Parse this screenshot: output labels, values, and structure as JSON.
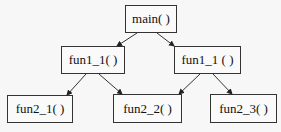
{
  "diagram": {
    "type": "call-tree",
    "nodes": [
      {
        "id": "main",
        "label": "main( )",
        "x": 125,
        "y": 5,
        "w": 52,
        "h": 28
      },
      {
        "id": "fun1_1a",
        "label": "fun1_1( )",
        "x": 61,
        "y": 46,
        "w": 64,
        "h": 28
      },
      {
        "id": "fun1_1b",
        "label": "fun1_1 ( )",
        "x": 174,
        "y": 46,
        "w": 67,
        "h": 28
      },
      {
        "id": "fun2_1",
        "label": "fun2_1( )",
        "x": 7,
        "y": 95,
        "w": 66,
        "h": 28
      },
      {
        "id": "fun2_2",
        "label": "fun2_2( )",
        "x": 113,
        "y": 94,
        "w": 69,
        "h": 29
      },
      {
        "id": "fun2_3",
        "label": "fun2_3( )",
        "x": 210,
        "y": 94,
        "w": 67,
        "h": 29
      }
    ],
    "edges": [
      {
        "from": "main",
        "to": "fun1_1a",
        "x1": 137,
        "y1": 33,
        "x2": 117,
        "y2": 46
      },
      {
        "from": "main",
        "to": "fun1_1b",
        "x1": 157,
        "y1": 33,
        "x2": 174,
        "y2": 46
      },
      {
        "from": "fun1_1a",
        "to": "fun2_1",
        "x1": 86,
        "y1": 74,
        "x2": 67,
        "y2": 95
      },
      {
        "from": "fun1_1a",
        "to": "fun2_2",
        "x1": 99,
        "y1": 74,
        "x2": 122,
        "y2": 94
      },
      {
        "from": "fun1_1b",
        "to": "fun2_2",
        "x1": 200,
        "y1": 74,
        "x2": 179,
        "y2": 94
      },
      {
        "from": "fun1_1b",
        "to": "fun2_3",
        "x1": 213,
        "y1": 74,
        "x2": 232,
        "y2": 94
      }
    ],
    "colors": {
      "stroke": "#333333",
      "background": "#f7f7f7",
      "text": "#111111"
    }
  }
}
